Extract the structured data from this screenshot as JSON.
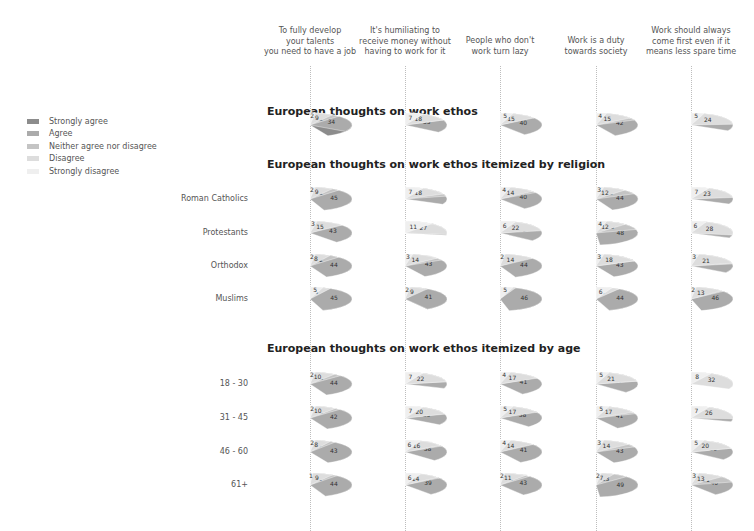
{
  "legend": {
    "items": [
      {
        "label": "Strongly agree",
        "color": "#8c8c8c"
      },
      {
        "label": "Agree",
        "color": "#ababab"
      },
      {
        "label": "Neither agree nor disagree",
        "color": "#c4c4c4"
      },
      {
        "label": "Disagree",
        "color": "#dddddd"
      },
      {
        "label": "Strongly disagree",
        "color": "#efefef"
      }
    ]
  },
  "columns": [
    {
      "label": "To fully develop\nyour talents\nyou need to have a job",
      "center_x": 310
    },
    {
      "label": "It's humiliating to\nreceive money without\nhaving to work for it",
      "center_x": 405
    },
    {
      "label": "People who don't\nwork turn lazy",
      "center_x": 500
    },
    {
      "label": "Work is a duty\ntowards society",
      "center_x": 596
    },
    {
      "label": "Work should always\ncome first even if it\nmeans less spare time",
      "center_x": 691
    }
  ],
  "sections": [
    {
      "title": "European thoughts on work ethos",
      "title_y": 113,
      "rows": [
        {
          "label": "",
          "y": 125,
          "pies": [
            [
              43,
              34,
              12,
              9,
              2
            ],
            [
              21,
              35,
              18,
              18,
              7
            ],
            [
              26,
              40,
              14,
              15,
              5
            ],
            [
              20,
              42,
              18,
              15,
              4
            ],
            [
              17,
              33,
              21,
              24,
              5
            ]
          ]
        }
      ]
    },
    {
      "title": "European thoughts on work ethos itemized by religion",
      "title_y": 166,
      "rows": [
        {
          "label": "Roman Catholics",
          "y": 199,
          "pies": [
            [
              33,
              45,
              12,
              9,
              2
            ],
            [
              21,
              32,
              21,
              18,
              7
            ],
            [
              26,
              40,
              16,
              14,
              4
            ],
            [
              24,
              44,
              18,
              12,
              3
            ],
            [
              17,
              32,
              21,
              23,
              7
            ]
          ]
        },
        {
          "label": "Protestants",
          "y": 233,
          "pies": [
            [
              37,
              43,
              12,
              15,
              3
            ],
            [
              13,
              28,
              21,
              27,
              11
            ],
            [
              16,
              36,
              20,
              22,
              6
            ],
            [
              15,
              48,
              20,
              12,
              4
            ],
            [
              10,
              32,
              25,
              28,
              6
            ]
          ]
        },
        {
          "label": "Orthodox",
          "y": 266,
          "pies": [
            [
              35,
              44,
              12,
              8,
              2
            ],
            [
              25,
              43,
              17,
              14,
              3
            ],
            [
              29,
              44,
              11,
              14,
              2
            ],
            [
              18,
              43,
              18,
              18,
              3
            ],
            [
              19,
              34,
              22,
              21,
              3
            ]
          ]
        },
        {
          "label": "Muslims",
          "y": 299,
          "pies": [
            [
              42,
              45,
              0,
              8,
              5
            ],
            [
              41,
              41,
              7,
              9,
              2
            ],
            [
              42,
              46,
              0,
              6,
              5
            ],
            [
              39,
              44,
              0,
              9,
              6
            ],
            [
              25,
              46,
              14,
              13,
              2
            ]
          ]
        }
      ]
    },
    {
      "title": "European thoughts on work ethos itemized by age",
      "title_y": 350,
      "rows": [
        {
          "label": "18 - 30",
          "y": 384,
          "pies": [
            [
              32,
              44,
              13,
              10,
              2
            ],
            [
              18,
              31,
              22,
              22,
              7
            ],
            [
              22,
              41,
              16,
              17,
              4
            ],
            [
              15,
              37,
              21,
              21,
              5
            ],
            [
              11,
              28,
              21,
              32,
              8
            ]
          ]
        },
        {
          "label": "31 - 45",
          "y": 418,
          "pies": [
            [
              31,
              42,
              12,
              10,
              2
            ],
            [
              20,
              35,
              19,
              20,
              7
            ],
            [
              25,
              38,
              15,
              17,
              5
            ],
            [
              17,
              41,
              19,
              17,
              5
            ],
            [
              15,
              30,
              22,
              26,
              7
            ]
          ]
        },
        {
          "label": "46 - 60",
          "y": 452,
          "pies": [
            [
              37,
              43,
              10,
              8,
              2
            ],
            [
              24,
              38,
              17,
              16,
              6
            ],
            [
              28,
              41,
              11,
              14,
              4
            ],
            [
              22,
              43,
              18,
              14,
              3
            ],
            [
              19,
              36,
              20,
              20,
              5
            ]
          ]
        },
        {
          "label": "61+",
          "y": 485,
          "pies": [
            [
              35,
              44,
              11,
              9,
              1
            ],
            [
              25,
              39,
              15,
              14,
              6
            ],
            [
              37,
              43,
              13,
              11,
              2
            ],
            [
              30,
              49,
              13,
              7,
              2
            ],
            [
              23,
              40,
              21,
              13,
              3
            ]
          ]
        }
      ]
    }
  ],
  "chart_data": {
    "type": "pie",
    "title": "European thoughts on work ethos",
    "series_order": [
      "Strongly agree",
      "Agree",
      "Neither agree nor disagree",
      "Disagree",
      "Strongly disagree"
    ],
    "statements": [
      "To fully develop your talents you need to have a job",
      "It's humiliating to receive money without having to work for it",
      "People who don't work turn lazy",
      "Work is a duty towards society",
      "Work should always come first even if it means less spare time"
    ],
    "groups": [
      {
        "section": "overall",
        "group": "All",
        "values": [
          [
            43,
            34,
            12,
            9,
            2
          ],
          [
            21,
            35,
            18,
            18,
            7
          ],
          [
            26,
            40,
            14,
            15,
            5
          ],
          [
            20,
            42,
            18,
            15,
            4
          ],
          [
            17,
            33,
            21,
            24,
            5
          ]
        ]
      },
      {
        "section": "religion",
        "group": "Roman Catholics",
        "values": [
          [
            33,
            45,
            12,
            9,
            2
          ],
          [
            21,
            32,
            21,
            18,
            7
          ],
          [
            26,
            40,
            16,
            14,
            4
          ],
          [
            24,
            44,
            18,
            12,
            3
          ],
          [
            17,
            32,
            21,
            23,
            7
          ]
        ]
      },
      {
        "section": "religion",
        "group": "Protestants",
        "values": [
          [
            37,
            43,
            12,
            15,
            3
          ],
          [
            13,
            28,
            21,
            27,
            11
          ],
          [
            16,
            36,
            20,
            22,
            6
          ],
          [
            15,
            48,
            20,
            12,
            4
          ],
          [
            10,
            32,
            25,
            28,
            6
          ]
        ]
      },
      {
        "section": "religion",
        "group": "Orthodox",
        "values": [
          [
            35,
            44,
            12,
            8,
            2
          ],
          [
            25,
            43,
            17,
            14,
            3
          ],
          [
            29,
            44,
            11,
            14,
            2
          ],
          [
            18,
            43,
            18,
            18,
            3
          ],
          [
            19,
            34,
            22,
            21,
            3
          ]
        ]
      },
      {
        "section": "religion",
        "group": "Muslims",
        "values": [
          [
            42,
            45,
            0,
            8,
            5
          ],
          [
            41,
            41,
            7,
            9,
            2
          ],
          [
            42,
            46,
            0,
            6,
            5
          ],
          [
            39,
            44,
            0,
            9,
            6
          ],
          [
            25,
            46,
            14,
            13,
            2
          ]
        ]
      },
      {
        "section": "age",
        "group": "18 - 30",
        "values": [
          [
            32,
            44,
            13,
            10,
            2
          ],
          [
            18,
            31,
            22,
            22,
            7
          ],
          [
            22,
            41,
            16,
            17,
            4
          ],
          [
            15,
            37,
            21,
            21,
            5
          ],
          [
            11,
            28,
            21,
            32,
            8
          ]
        ]
      },
      {
        "section": "age",
        "group": "31 - 45",
        "values": [
          [
            31,
            42,
            12,
            10,
            2
          ],
          [
            20,
            35,
            19,
            20,
            7
          ],
          [
            25,
            38,
            15,
            17,
            5
          ],
          [
            17,
            41,
            19,
            17,
            5
          ],
          [
            15,
            30,
            22,
            26,
            7
          ]
        ]
      },
      {
        "section": "age",
        "group": "46 - 60",
        "values": [
          [
            37,
            43,
            10,
            8,
            2
          ],
          [
            24,
            38,
            17,
            16,
            6
          ],
          [
            28,
            41,
            11,
            14,
            4
          ],
          [
            22,
            43,
            18,
            14,
            3
          ],
          [
            19,
            36,
            20,
            20,
            5
          ]
        ]
      },
      {
        "section": "age",
        "group": "61+",
        "values": [
          [
            35,
            44,
            11,
            9,
            1
          ],
          [
            25,
            39,
            15,
            14,
            6
          ],
          [
            37,
            43,
            13,
            11,
            2
          ],
          [
            30,
            49,
            13,
            7,
            2
          ],
          [
            23,
            40,
            21,
            13,
            3
          ]
        ]
      }
    ],
    "legend_position": "left"
  }
}
